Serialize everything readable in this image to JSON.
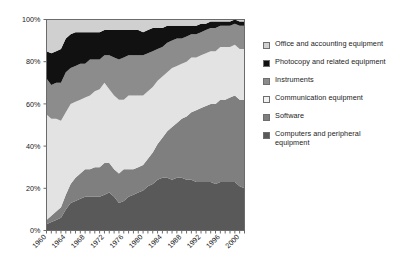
{
  "chart_data": {
    "type": "area",
    "stacked": true,
    "normalized": true,
    "title": "",
    "subtitle": "",
    "xlabel": "",
    "ylabel": "",
    "grid": false,
    "legend_position": "right",
    "xlim": [
      1960,
      2001
    ],
    "ylim": [
      0,
      100
    ],
    "ytick_labels": [
      "0%",
      "20%",
      "40%",
      "60%",
      "80%",
      "100%"
    ],
    "ytick_values": [
      0,
      20,
      40,
      60,
      80,
      100
    ],
    "xtick_labels": [
      "1960",
      "1964",
      "1968",
      "1972",
      "1976",
      "1980",
      "1984",
      "1988",
      "1992",
      "1996",
      "2000"
    ],
    "xtick_values": [
      1960,
      1964,
      1968,
      1972,
      1976,
      1980,
      1984,
      1988,
      1992,
      1996,
      2000
    ],
    "minor_xticks_every": 1,
    "x": [
      1960,
      1961,
      1962,
      1963,
      1964,
      1965,
      1966,
      1967,
      1968,
      1969,
      1970,
      1971,
      1972,
      1973,
      1974,
      1975,
      1976,
      1977,
      1978,
      1979,
      1980,
      1981,
      1982,
      1983,
      1984,
      1985,
      1986,
      1987,
      1988,
      1989,
      1990,
      1991,
      1992,
      1993,
      1994,
      1995,
      1996,
      1997,
      1998,
      1999,
      2000,
      2001
    ],
    "series": [
      {
        "name": "Computers and peripheral equipment",
        "color": "#595959",
        "values": [
          3,
          4,
          5,
          6,
          10,
          13,
          14,
          15,
          16,
          16,
          16,
          16,
          17,
          18,
          16,
          13,
          14,
          16,
          17,
          18,
          19,
          21,
          22,
          24,
          25,
          25,
          24,
          25,
          25,
          24,
          24,
          23,
          23,
          23,
          23,
          22,
          23,
          23,
          23,
          23,
          21,
          20
        ]
      },
      {
        "name": "Software",
        "color": "#7f7f7f",
        "values": [
          2,
          3,
          4,
          5,
          7,
          9,
          11,
          12,
          13,
          13,
          14,
          14,
          15,
          14,
          13,
          14,
          15,
          13,
          12,
          12,
          12,
          13,
          15,
          17,
          19,
          22,
          25,
          26,
          28,
          30,
          32,
          34,
          35,
          36,
          37,
          38,
          39,
          39,
          40,
          41,
          41,
          42
        ]
      },
      {
        "name": "Communication equipment",
        "color": "#e3e3e3",
        "values": [
          50,
          46,
          44,
          41,
          39,
          38,
          36,
          35,
          34,
          35,
          36,
          37,
          38,
          35,
          35,
          35,
          33,
          35,
          35,
          34,
          33,
          32,
          31,
          30,
          29,
          28,
          28,
          27,
          26,
          26,
          26,
          25,
          25,
          25,
          25,
          25,
          25,
          25,
          24,
          24,
          24,
          24
        ]
      },
      {
        "name": "Instruments",
        "color": "#8c8c8c",
        "values": [
          17,
          16,
          17,
          18,
          19,
          17,
          17,
          17,
          16,
          17,
          15,
          14,
          13,
          16,
          18,
          19,
          20,
          19,
          19,
          19,
          19,
          18,
          17,
          15,
          14,
          14,
          13,
          13,
          12,
          12,
          11,
          11,
          11,
          11,
          11,
          11,
          10,
          10,
          10,
          10,
          11,
          11
        ]
      },
      {
        "name": "Photocopy and related equipment",
        "color": "#111111",
        "values": [
          13,
          15,
          15,
          16,
          16,
          16,
          16,
          15,
          15,
          13,
          13,
          13,
          12,
          12,
          13,
          14,
          13,
          12,
          12,
          12,
          11,
          11,
          11,
          10,
          9,
          8,
          7,
          6,
          6,
          5,
          4,
          4,
          4,
          3,
          3,
          3,
          2,
          2,
          2,
          2,
          2,
          2
        ]
      },
      {
        "name": "Office and accounting equipment",
        "color": "#d0d0d0",
        "values": [
          15,
          16,
          15,
          14,
          9,
          7,
          6,
          6,
          6,
          6,
          6,
          6,
          5,
          5,
          5,
          5,
          5,
          5,
          5,
          5,
          6,
          5,
          4,
          4,
          4,
          3,
          3,
          3,
          3,
          3,
          3,
          3,
          2,
          2,
          1,
          1,
          1,
          1,
          1,
          0,
          1,
          1
        ]
      }
    ]
  },
  "legend": {
    "items": [
      {
        "label": "Office and accounting equipment",
        "color": "#d0d0d0",
        "swatch_name": "legend-swatch-office-and-accounting-equipment"
      },
      {
        "label": "Photocopy and related equipment",
        "color": "#111111",
        "swatch_name": "legend-swatch-photocopy-and-related-equipment"
      },
      {
        "label": "Instruments",
        "color": "#8c8c8c",
        "swatch_name": "legend-swatch-instruments"
      },
      {
        "label": "Communication equipment",
        "color": "#f2f2f2",
        "swatch_name": "legend-swatch-communication-equipment"
      },
      {
        "label": "Software",
        "color": "#7f7f7f",
        "swatch_name": "legend-swatch-software"
      },
      {
        "label": "Computers and peripheral equipment",
        "color": "#595959",
        "swatch_name": "legend-swatch-computers-and-peripheral-equipment"
      }
    ]
  },
  "plot": {
    "border_color": "#6b6b6b",
    "background": "#ffffff"
  }
}
